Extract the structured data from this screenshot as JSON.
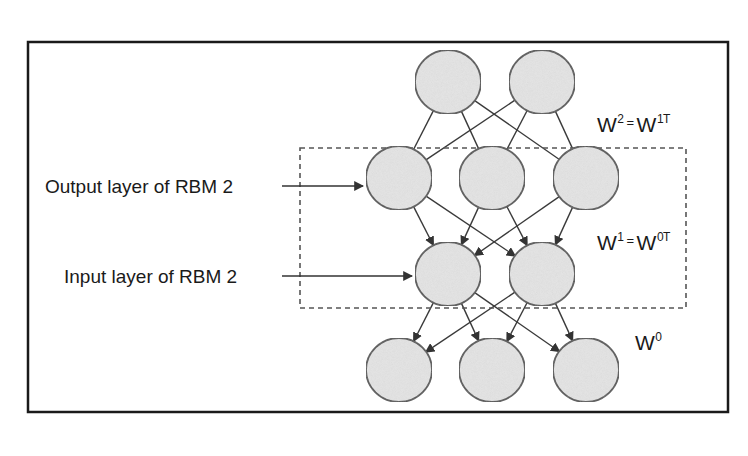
{
  "diagram": {
    "type": "deep-belief-network",
    "frame": {
      "x": 28,
      "y": 42,
      "width": 700,
      "height": 370,
      "stroke": "#1a1a1a"
    },
    "rbm_box": {
      "x": 300,
      "y": 148,
      "width": 386,
      "height": 160,
      "stroke": "#555555",
      "dash": "5,4"
    },
    "node_style": {
      "fill": "#e4e4e4",
      "stroke": "#555555",
      "rx": 33,
      "ry": 32
    },
    "layers": [
      {
        "name": "top",
        "nodes": [
          {
            "cx": 448,
            "cy": 82
          },
          {
            "cx": 542,
            "cy": 82
          }
        ]
      },
      {
        "name": "rbm2-output",
        "nodes": [
          {
            "cx": 399,
            "cy": 178
          },
          {
            "cx": 492,
            "cy": 178
          },
          {
            "cx": 586,
            "cy": 178
          }
        ]
      },
      {
        "name": "rbm2-input",
        "nodes": [
          {
            "cx": 448,
            "cy": 274
          },
          {
            "cx": 542,
            "cy": 274
          }
        ]
      },
      {
        "name": "bottom",
        "nodes": [
          {
            "cx": 399,
            "cy": 370
          },
          {
            "cx": 492,
            "cy": 370
          },
          {
            "cx": 586,
            "cy": 370
          }
        ]
      }
    ],
    "weight_labels": [
      {
        "id": "w2",
        "base": "W",
        "sup": "2",
        "eq": "=",
        "rhs_base": "W",
        "rhs_sup": "1T",
        "x": 597,
        "y": 112
      },
      {
        "id": "w1",
        "base": "W",
        "sup": "1",
        "eq": "=",
        "rhs_base": "W",
        "rhs_sup": "0T",
        "x": 597,
        "y": 230
      },
      {
        "id": "w0",
        "base": "W",
        "sup": "0",
        "x": 635,
        "y": 330
      }
    ],
    "annotations": [
      {
        "id": "output-layer",
        "text": "Output layer of RBM 2",
        "x": 45,
        "y": 176,
        "arrow_from": [
          282,
          186
        ],
        "arrow_to": [
          363,
          186
        ]
      },
      {
        "id": "input-layer",
        "text": "Input layer of RBM 2",
        "x": 64,
        "y": 266,
        "arrow_from": [
          282,
          276
        ],
        "arrow_to": [
          412,
          276
        ]
      }
    ]
  }
}
